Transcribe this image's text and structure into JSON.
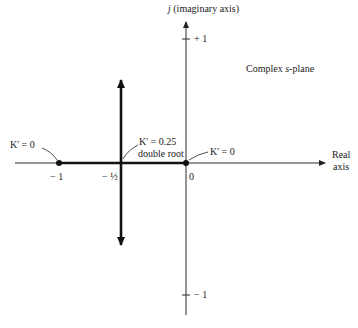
{
  "diagram": {
    "title": "Complex s-plane",
    "title_parts": [
      "Complex ",
      "s",
      "-plane"
    ],
    "imag_axis_label": {
      "j": "j",
      "rest": " (imaginary axis)"
    },
    "real_axis_label": [
      "Real",
      "axis"
    ],
    "ticks": {
      "imag_plus_one": "+ 1",
      "imag_minus_one": "− 1",
      "real_minus_one": "− 1",
      "real_minus_half": "− ½",
      "origin": "0"
    },
    "annotations": {
      "left_pole": "K' = 0",
      "right_pole": "K' = 0",
      "breakaway_line1": "K' = 0.25",
      "breakaway_line2": "double root"
    },
    "poles": [
      -1,
      0
    ],
    "breakaway_point": -0.5,
    "breakaway_gain": 0.25,
    "colors": {
      "ink": "#111111",
      "background": "#ffffff"
    }
  }
}
